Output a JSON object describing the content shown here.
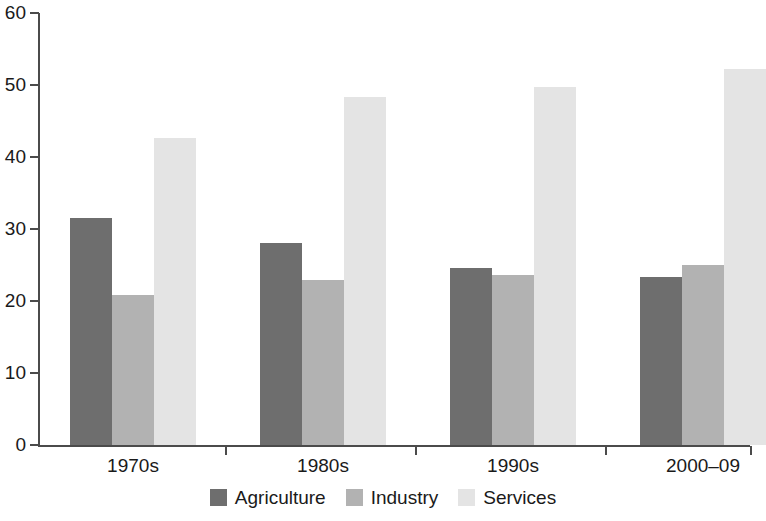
{
  "chart_data": {
    "type": "bar",
    "title": "",
    "subtitle": "",
    "xlabel": "",
    "ylabel": "",
    "categories": [
      "1970s",
      "1980s",
      "1990s",
      "2000–09"
    ],
    "series": [
      {
        "name": "Agriculture",
        "color": "#6e6e6e",
        "values": [
          31.5,
          28.1,
          24.6,
          23.3
        ]
      },
      {
        "name": "Industry",
        "color": "#b2b2b2",
        "values": [
          20.9,
          22.9,
          23.6,
          25.0
        ]
      },
      {
        "name": "Services",
        "color": "#e4e4e4",
        "values": [
          42.7,
          48.4,
          49.7,
          52.2
        ]
      }
    ],
    "ylim": [
      0,
      60
    ],
    "yticks": [
      0,
      10,
      20,
      30,
      40,
      50,
      60
    ],
    "ytick_labels": [
      "0",
      "10",
      "20",
      "30",
      "40",
      "50",
      "60"
    ],
    "grid": false,
    "legend_position": "bottom"
  },
  "axes": {
    "y_tick_labels": [
      "60",
      "50",
      "40",
      "30",
      "20",
      "10",
      "0"
    ],
    "x_tick_labels": [
      "1970s",
      "1980s",
      "1990s",
      "2000–09"
    ]
  },
  "legend": {
    "items": [
      {
        "label": "Agriculture",
        "color": "#6e6e6e"
      },
      {
        "label": "Industry",
        "color": "#b2b2b2"
      },
      {
        "label": "Services",
        "color": "#e4e4e4"
      }
    ]
  }
}
